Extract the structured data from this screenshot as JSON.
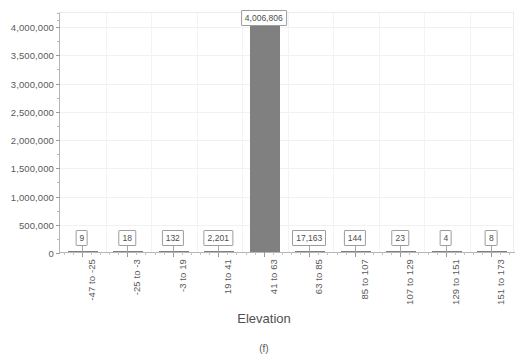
{
  "chart_data": {
    "type": "bar",
    "title": "",
    "subtitle": "",
    "xlabel": "Elevation",
    "ylabel": "",
    "caption": "(f)",
    "grid": true,
    "legend": false,
    "ylim": [
      0,
      4250000
    ],
    "ytick_labels": [
      "0",
      "500,000",
      "1,000,000",
      "1,500,000",
      "2,000,000",
      "2,500,000",
      "3,000,000",
      "3,500,000",
      "4,000,000"
    ],
    "ytick_values": [
      0,
      500000,
      1000000,
      1500000,
      2000000,
      2500000,
      3000000,
      3500000,
      4000000
    ],
    "categories": [
      "-47 to -25",
      "-25 to -3",
      "-3 to 19",
      "19 to 41",
      "41 to 63",
      "63 to 85",
      "85 to 107",
      "107 to 129",
      "129 to 151",
      "151 to 173"
    ],
    "values": [
      9,
      18,
      132,
      2201,
      4006806,
      17163,
      144,
      23,
      4,
      8
    ],
    "value_labels": [
      "9",
      "18",
      "132",
      "2,201",
      "4,006,806",
      "17,163",
      "144",
      "23",
      "4",
      "8"
    ],
    "bar_color": "#808080",
    "axis_color": "#b6b6b6",
    "grid_color": "#f1f1f1",
    "text_color": "#595959"
  }
}
